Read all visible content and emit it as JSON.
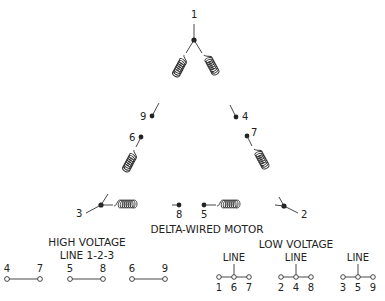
{
  "diagram": {
    "title": "DELTA-WIRED MOTOR",
    "terminals": {
      "t1": "1",
      "t2": "2",
      "t3": "3",
      "t4": "4",
      "t5": "5",
      "t6": "6",
      "t7": "7",
      "t8": "8",
      "t9": "9"
    },
    "windings": [
      {
        "from": "1",
        "to": "9"
      },
      {
        "from": "1",
        "to": "4"
      },
      {
        "from": "6",
        "to": "3"
      },
      {
        "from": "7",
        "to": "2"
      },
      {
        "from": "3",
        "to": "8"
      },
      {
        "from": "5",
        "to": "2"
      }
    ]
  },
  "high_voltage": {
    "title": "HIGH VOLTAGE",
    "subtitle": "LINE 1-2-3",
    "pairs": [
      {
        "a": "4",
        "b": "7"
      },
      {
        "a": "5",
        "b": "8"
      },
      {
        "a": "6",
        "b": "9"
      }
    ]
  },
  "low_voltage": {
    "title": "LOW VOLTAGE",
    "groups": [
      {
        "line_label": "LINE",
        "a": "1",
        "b": "6",
        "c": "7"
      },
      {
        "line_label": "LINE",
        "a": "2",
        "b": "4",
        "c": "8"
      },
      {
        "line_label": "LINE",
        "a": "3",
        "b": "5",
        "c": "9"
      }
    ]
  }
}
